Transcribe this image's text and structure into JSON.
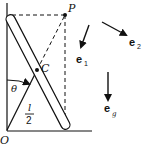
{
  "diagram": {
    "type": "physics-figure",
    "labels": {
      "origin": "O",
      "point_p": "P",
      "center": "C",
      "angle": "θ",
      "half_length_num": "l",
      "half_length_den": "2",
      "e1_base": "e",
      "e1_sub": "1",
      "e2_base": "e",
      "e2_sub": "2",
      "eg_base": "e",
      "eg_sub": "g"
    },
    "colors": {
      "ink": "#111111",
      "background": "#ffffff"
    }
  }
}
